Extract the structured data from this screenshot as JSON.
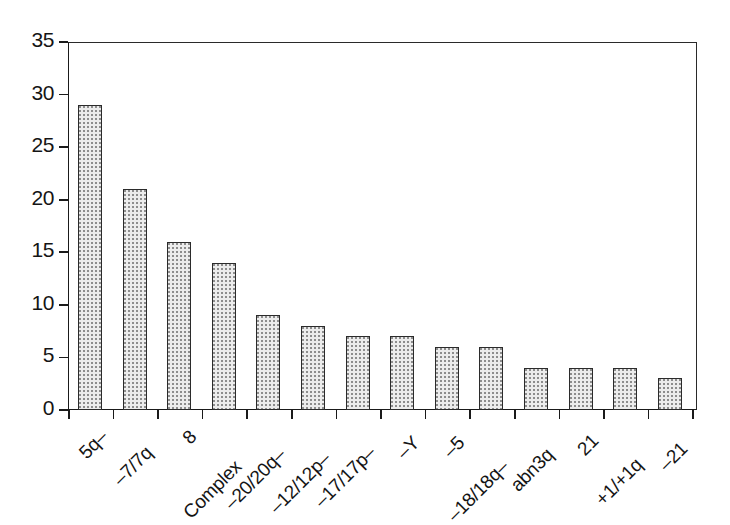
{
  "chart_data": {
    "type": "bar",
    "title": "",
    "subtitle": "",
    "xlabel": "",
    "ylabel": "",
    "categories": [
      "5q–",
      "–7/7q",
      "8",
      "Complex",
      "–20/20q–",
      "–12/12p–",
      "–17/17p–",
      "–Y",
      "–5",
      "–18/18q–",
      "abn3q",
      "21",
      "+1/+1q",
      "–21"
    ],
    "values": [
      29,
      21,
      16,
      14,
      9,
      8,
      7,
      7,
      6,
      6,
      4,
      4,
      4,
      3
    ],
    "ylim": [
      0,
      35
    ],
    "ytick_values": [
      0,
      5,
      10,
      15,
      20,
      25,
      30,
      35
    ],
    "ytick_labels": [
      "0",
      "5",
      "10",
      "15",
      "20",
      "25",
      "30",
      "35"
    ],
    "ytick_interval": 5,
    "grid": false,
    "legend": null,
    "legend_position": "none",
    "bar_fill": "#ececec",
    "bar_edge": "#2b2b2b",
    "axis_color": "#1a1a1a",
    "background": "#ffffff",
    "xtick_position": "between-bars",
    "xlabel_rotation_deg": -45,
    "annotations": []
  }
}
